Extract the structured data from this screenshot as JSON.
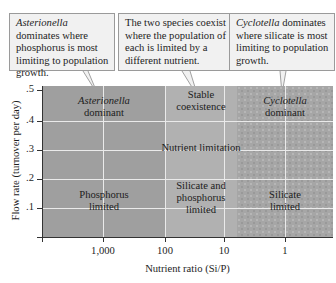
{
  "callouts": [
    {
      "species": "Asterionella",
      "text": " dominates where phosphorus is most limiting to population growth."
    },
    {
      "text": "The two species coexist where the population of each is limited by a different nutrient."
    },
    {
      "species": "Cyclotella",
      "text": " dominates where silicate is most limiting to population growth."
    }
  ],
  "regions": {
    "left": {
      "species": "Asterionella",
      "line2": "dominant",
      "limit1": "Phosphorus",
      "limit2": "limited"
    },
    "middle": {
      "line1": "Stable",
      "line2": "coexistence",
      "center": "Nutrient limitation",
      "limit1": "Silicate and",
      "limit2": "phosphorus",
      "limit3": "limited"
    },
    "right": {
      "species": "Cyclotella",
      "line2": "dominant",
      "limit1": "Silicate",
      "limit2": "limited"
    }
  },
  "axes": {
    "y_title": "Flow rate (turnover per day)",
    "y_ticks": [
      ".5",
      ".4",
      ".3",
      ".2",
      ".1"
    ],
    "x_title": "Nutrient ratio (Si/P)",
    "x_ticks": [
      "1,000",
      "100",
      "10",
      "1"
    ]
  },
  "colors": {
    "phosphorus_region": "#9f9f9f",
    "coexistence_region": "#b1b1b1",
    "silicate_region": "#a6a6a6",
    "callout_bg": "#f1f1f1"
  }
}
